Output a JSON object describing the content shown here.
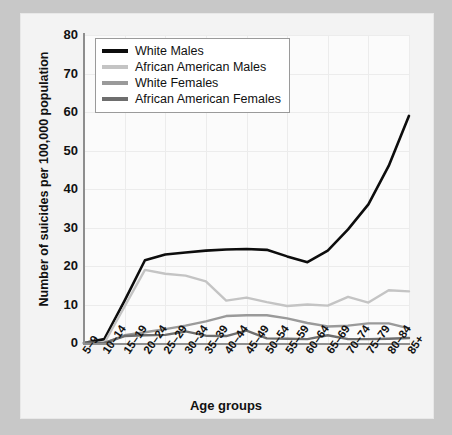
{
  "chart_data": {
    "type": "line",
    "title": "",
    "xlabel": "Age groups",
    "ylabel": "Number of suicides per 100,000 population",
    "categories": [
      "5–9",
      "10–14",
      "15–19",
      "20–24",
      "25–29",
      "30–34",
      "35–39",
      "40–44",
      "45–49",
      "50–54",
      "55–59",
      "60–64",
      "65–69",
      "70–74",
      "75–79",
      "80–84",
      "85+"
    ],
    "ylim": [
      0,
      80
    ],
    "yticks": [
      0,
      10,
      20,
      30,
      40,
      50,
      60,
      70,
      80
    ],
    "grid": true,
    "legend_position": "top-left",
    "series": [
      {
        "name": "White Males",
        "color": "#0d0d0d",
        "values": [
          0,
          1,
          11,
          21.5,
          23,
          23.5,
          24,
          24.3,
          24.4,
          24.2,
          22.5,
          21,
          24,
          29.5,
          36,
          46,
          59
        ]
      },
      {
        "name": "African American Males",
        "color": "#c4c4c4",
        "values": [
          0,
          0,
          9.5,
          19,
          18,
          17.5,
          16,
          11,
          11.8,
          10.6,
          9.6,
          10,
          9.7,
          12,
          10.5,
          13.7,
          13.4
        ]
      },
      {
        "name": "White Females",
        "color": "#9a9a9a",
        "values": [
          0,
          0,
          2,
          2.8,
          3.6,
          4.5,
          5.6,
          7,
          7.2,
          7.2,
          6.4,
          5.2,
          4.3,
          4.5,
          5.1,
          5.1,
          3.8
        ]
      },
      {
        "name": "African American Females",
        "color": "#6e6e6e",
        "values": [
          0,
          0,
          1.8,
          2,
          2.1,
          3,
          1.9,
          1.8,
          3.2,
          1.2,
          1.1,
          1,
          2,
          1,
          1,
          1.1,
          1.3
        ]
      }
    ]
  },
  "ytick_labels": [
    "80",
    "70",
    "60",
    "50",
    "40",
    "30",
    "20",
    "10",
    "0"
  ],
  "legend": {
    "items": [
      {
        "label": "White Males",
        "color": "#0d0d0d"
      },
      {
        "label": "African American Males",
        "color": "#c4c4c4"
      },
      {
        "label": "White Females",
        "color": "#9a9a9a"
      },
      {
        "label": "African American Females",
        "color": "#6e6e6e"
      }
    ]
  }
}
